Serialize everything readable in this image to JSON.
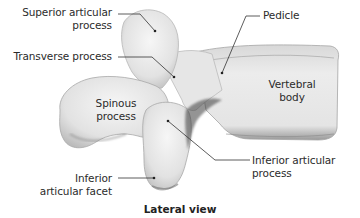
{
  "figure": {
    "caption": "Lateral view",
    "labels": {
      "superior_articular_process": [
        "Superior articular",
        "process"
      ],
      "transverse_process": [
        "Transverse process"
      ],
      "pedicle": [
        "Pedicle"
      ],
      "vertebral_body": [
        "Vertebral",
        "body"
      ],
      "spinous_process": [
        "Spinous",
        "process"
      ],
      "inferior_articular_process": [
        "Inferior articular",
        "process"
      ],
      "inferior_articular_facet": [
        "Inferior",
        "articular facet"
      ]
    },
    "colors": {
      "bone_light": "#efefef",
      "bone_mid": "#d4d4d4",
      "bone_shadow": "#8a8a8a",
      "leader_line": "#333333",
      "text": "#2b2b2b"
    }
  }
}
